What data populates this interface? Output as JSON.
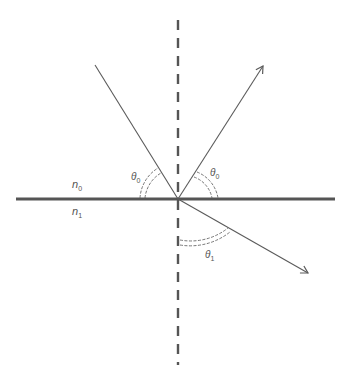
{
  "diagram": {
    "colors": {
      "interface": "#555555",
      "ray": "#5a5a5a",
      "normal": "#555555",
      "text": "#555555",
      "background": "#ffffff"
    },
    "origin": {
      "x": 178,
      "y": 199
    },
    "interface_line": {
      "x1": 16,
      "x2": 335,
      "y": 199
    },
    "normal_line": {
      "x": 178,
      "y1": 20,
      "y2": 365
    },
    "rays": {
      "incident": {
        "from": [
          95,
          65
        ],
        "to": [
          178,
          199
        ]
      },
      "reflected": {
        "from": [
          178,
          199
        ],
        "to": [
          263,
          66
        ]
      },
      "refracted": {
        "from": [
          178,
          199
        ],
        "to": [
          308,
          273
        ]
      }
    },
    "labels": {
      "n0": {
        "base": "n",
        "sub": "0"
      },
      "n1": {
        "base": "n",
        "sub": "1"
      },
      "theta_incident": {
        "base": "θ",
        "sub": "0"
      },
      "theta_reflected": {
        "base": "θ",
        "sub": "0"
      },
      "theta_refracted": {
        "base": "θ",
        "sub": "1"
      }
    }
  }
}
